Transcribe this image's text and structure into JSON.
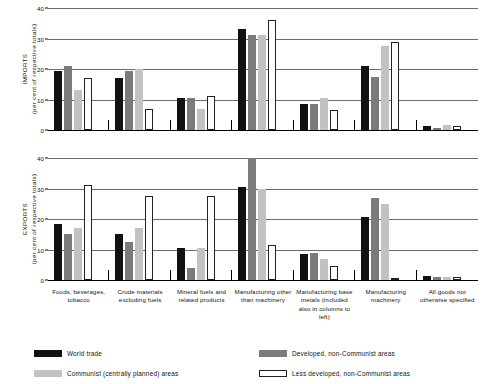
{
  "chart_data": {
    "type": "bar",
    "title": "",
    "orientation": "vertical",
    "grouped": true,
    "grid": true,
    "legend_position": "bottom",
    "categories": [
      "Foods, beverages, tobacco",
      "Crude materials excluding fuels",
      "Mineral fuels and related products",
      "Manufacturing other than machinery",
      "Manufacturing base metals (included also in columns to left)",
      "Manufacturing machinery",
      "All goods not otherwise specified"
    ],
    "panels": [
      {
        "name": "imports",
        "ylabel_caption": "IMPORTS",
        "ylabel_sub": "(per cent of respective totals)",
        "ylim": [
          0,
          40
        ],
        "yticks": [
          0,
          10,
          20,
          30,
          40
        ],
        "series": [
          {
            "name": "World trade",
            "values": [
              19.5,
              17.0,
              10.5,
              33.0,
              8.5,
              21.0,
              1.2
            ]
          },
          {
            "name": "Developed, non-Communist areas",
            "values": [
              21.0,
              19.5,
              10.5,
              31.0,
              8.5,
              17.5,
              0.8
            ]
          },
          {
            "name": "Communist (centrally planned) areas",
            "values": [
              13.0,
              20.0,
              7.0,
              31.0,
              10.5,
              27.5,
              1.5
            ]
          },
          {
            "name": "Less developed, non-Communist areas",
            "values": [
              17.0,
              7.0,
              11.0,
              36.0,
              6.5,
              29.0,
              1.2
            ]
          }
        ]
      },
      {
        "name": "exports",
        "ylabel_caption": "EXPORTS",
        "ylabel_sub": "(per cent of respective totals)",
        "ylim": [
          0,
          40
        ],
        "yticks": [
          0,
          10,
          20,
          30,
          40
        ],
        "series": [
          {
            "name": "World trade",
            "values": [
              18.5,
              15.0,
              10.5,
              30.5,
              8.5,
              20.5,
              1.2
            ]
          },
          {
            "name": "Developed, non-Communist areas",
            "values": [
              15.0,
              12.5,
              4.0,
              40.0,
              9.0,
              27.0,
              1.0
            ]
          },
          {
            "name": "Communist (centrally planned) areas",
            "values": [
              17.0,
              17.0,
              10.5,
              30.0,
              7.0,
              25.0,
              1.0
            ]
          },
          {
            "name": "Less developed, non-Communist areas",
            "values": [
              31.0,
              27.5,
              27.5,
              11.5,
              4.5,
              0.7,
              1.0
            ]
          }
        ]
      }
    ],
    "legend": [
      {
        "label": "World trade",
        "color": "#111111",
        "style": "filled"
      },
      {
        "label": "Developed, non-Communist areas",
        "color": "#7b7b7b",
        "style": "filled"
      },
      {
        "label": "Communist (centrally planned) areas",
        "color": "#c2c2c2",
        "style": "filled"
      },
      {
        "label": "Less developed, non-Communist areas",
        "color": "#ffffff",
        "style": "outline"
      }
    ]
  }
}
